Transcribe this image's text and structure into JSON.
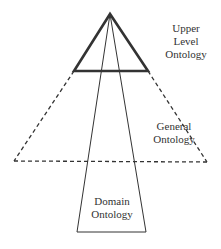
{
  "diagram": {
    "type": "ontology-layers",
    "colors": {
      "stroke": "#333333",
      "text": "#333333",
      "background": "#ffffff"
    },
    "shapes": {
      "upper_level": {
        "kind": "triangle",
        "stroke_style": "solid-thick",
        "points": [
          [
            110,
            14
          ],
          [
            74,
            71
          ],
          [
            148,
            71
          ]
        ]
      },
      "general": {
        "kind": "trapezoid",
        "stroke_style": "dashed",
        "points": [
          [
            74,
            71
          ],
          [
            148,
            71
          ],
          [
            207,
            162
          ],
          [
            14,
            161
          ]
        ]
      },
      "domain": {
        "kind": "trapezoid",
        "stroke_style": "solid-thin",
        "points": [
          [
            110,
            14
          ],
          [
            77,
            232
          ],
          [
            146,
            232
          ]
        ]
      }
    },
    "labels": {
      "upper": {
        "line1": "Upper",
        "line2": "Level",
        "line3": "Ontology"
      },
      "general": {
        "line1": "General",
        "line2": "Ontology"
      },
      "domain": {
        "line1": "Domain",
        "line2": "Ontology"
      }
    }
  }
}
